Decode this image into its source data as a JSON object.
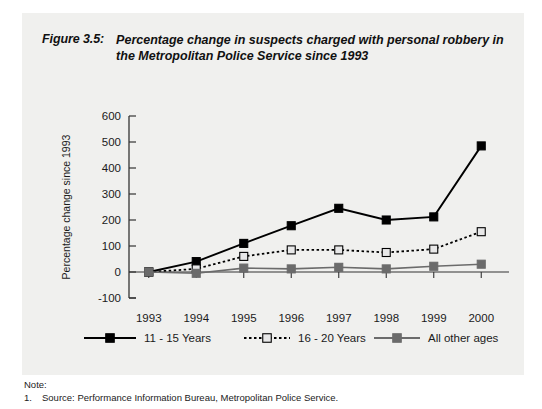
{
  "figure": {
    "number": "Figure 3.5:",
    "title": "Percentage change in suspects charged with personal robbery in the Metropolitan Police Service since 1993"
  },
  "notes": {
    "heading": "Note:",
    "items": [
      {
        "number": "1.",
        "text": "Source: Performance Information Bureau, Metropolitan Police Service."
      }
    ]
  },
  "colors": {
    "panel_background": "#f0f0ee",
    "page_background": "#ffffff",
    "series_1": "#000000",
    "series_2_line": "#000000",
    "series_2_marker_fill": "#e8e8e8",
    "series_3": "#6b6b6b",
    "axis": "#333333",
    "text": "#1a1a1a"
  },
  "chart_data": {
    "type": "line",
    "title": "Percentage change in suspects charged with personal robbery in the Metropolitan Police Service since 1993",
    "xlabel": "",
    "ylabel": "Percentage change since 1993",
    "categories": [
      "1993",
      "1994",
      "1995",
      "1996",
      "1997",
      "1998",
      "1999",
      "2000"
    ],
    "x_tick_labels": [
      "1993",
      "1994",
      "1995",
      "1996",
      "1997",
      "1998",
      "1999",
      "2000"
    ],
    "y_tick_labels": [
      "-100",
      "0",
      "100",
      "200",
      "300",
      "400",
      "500",
      "600"
    ],
    "ylim": [
      -100,
      600
    ],
    "y_tick_step": 100,
    "grid": false,
    "legend_position": "bottom",
    "series": [
      {
        "name": "11 - 15 Years",
        "values": [
          0,
          40,
          110,
          178,
          245,
          200,
          212,
          485
        ],
        "line_style": "solid",
        "marker": "filled-square",
        "color": "#000000"
      },
      {
        "name": "16 - 20 Years",
        "values": [
          0,
          12,
          60,
          85,
          85,
          75,
          88,
          155
        ],
        "line_style": "dotted",
        "marker": "open-square",
        "color": "#000000"
      },
      {
        "name": "All other ages",
        "values": [
          0,
          -5,
          15,
          12,
          18,
          12,
          22,
          30
        ],
        "line_style": "solid",
        "marker": "filled-square",
        "color": "#6b6b6b"
      }
    ]
  }
}
